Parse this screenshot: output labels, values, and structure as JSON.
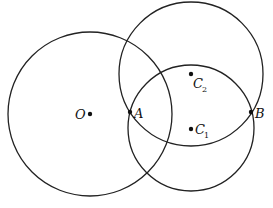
{
  "diagram": {
    "type": "geometry-circles",
    "stroke_color": "#222222",
    "circles": [
      {
        "name": "circle-O",
        "center": "O",
        "cx": 90,
        "cy": 114,
        "r": 82
      },
      {
        "name": "circle-C2",
        "center": "C2",
        "cx": 191,
        "cy": 74,
        "r": 72
      },
      {
        "name": "circle-C1",
        "center": "C1",
        "cx": 191,
        "cy": 128,
        "r": 63
      }
    ],
    "points": {
      "O": {
        "label": "O",
        "subscript": "",
        "x": 90,
        "y": 114
      },
      "A": {
        "label": "A",
        "subscript": "",
        "x": 130,
        "y": 112
      },
      "B": {
        "label": "B",
        "subscript": "",
        "x": 251,
        "y": 112
      },
      "C1": {
        "label": "C",
        "subscript": "1",
        "x": 191,
        "y": 129
      },
      "C2": {
        "label": "C",
        "subscript": "2",
        "x": 191,
        "y": 74
      }
    }
  }
}
